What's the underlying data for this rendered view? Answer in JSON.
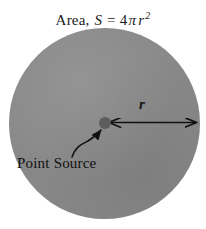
{
  "figure": {
    "caption_title": {
      "prefix": "Area,",
      "quantity_symbol": "S",
      "equals": "=",
      "coefficient": "4",
      "pi_symbol": "π",
      "radius_symbol": "r",
      "exponent": "2",
      "full_text": "Area, S = 4πr²"
    },
    "labels": {
      "radius": "r",
      "point_source": "Point Source"
    },
    "colors": {
      "background": "#ffffff",
      "sphere_fill": "#898989",
      "point_dot": "#5d5d5d",
      "ink": "#101010"
    },
    "geometry": {
      "sphere_center_x": 105,
      "sphere_center_y": 123,
      "sphere_radius": 95,
      "radius_arrow_start_x": 110,
      "radius_arrow_end_x": 197,
      "radius_arrow_y": 123
    }
  }
}
